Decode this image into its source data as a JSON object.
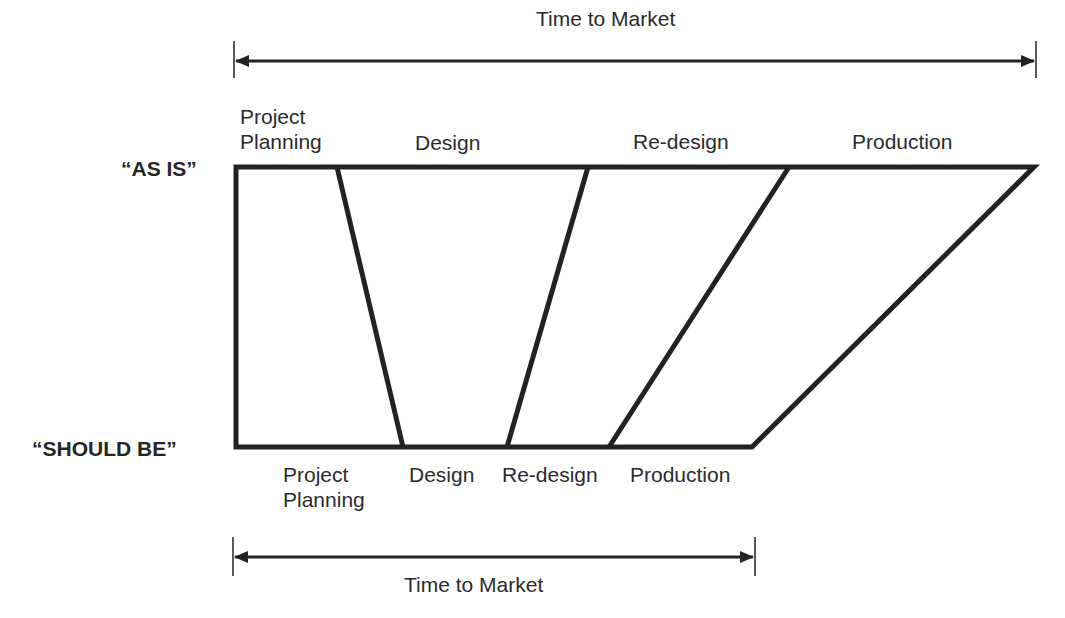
{
  "diagram": {
    "rows": {
      "as_is": "“AS IS”",
      "should_be": "“SHOULD BE”"
    },
    "top_arrow": {
      "label": "Time to Market"
    },
    "bottom_arrow": {
      "label": "Time to Market"
    },
    "as_is_phases": [
      {
        "line1": "Project",
        "line2": "Planning"
      },
      {
        "line1": "Design"
      },
      {
        "line1": "Re-design"
      },
      {
        "line1": "Production"
      }
    ],
    "should_be_phases": [
      {
        "line1": "Project",
        "line2": "Planning"
      },
      {
        "line1": "Design"
      },
      {
        "line1": "Re-design"
      },
      {
        "line1": "Production"
      }
    ],
    "colors": {
      "stroke": "#222222",
      "text": "#2b2b2b",
      "background": "#ffffff"
    }
  }
}
